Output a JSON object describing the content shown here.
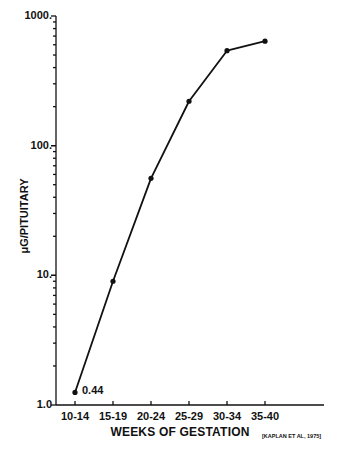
{
  "chart_data": {
    "type": "line",
    "title": "",
    "xlabel": "WEEKS OF GESTATION",
    "ylabel": "μG/PITUITARY",
    "yscale": "log",
    "ylim": [
      1.0,
      1000
    ],
    "y_tick_labels": [
      "1.0",
      "10.",
      "100.",
      "1000."
    ],
    "categories": [
      "10-14",
      "15-19",
      "20-24",
      "25-29",
      "30-34",
      "35-40"
    ],
    "series": [
      {
        "name": "Pituitary content",
        "values": [
          1.25,
          9,
          56,
          220,
          540,
          640
        ],
        "marker": "circle",
        "color": "#111111"
      }
    ],
    "annotations": [
      {
        "text": "0.44",
        "category": "10-14"
      }
    ],
    "source": "[KAPLAN ET AL, 1975]",
    "grid": false,
    "legend": "none"
  },
  "labels": {
    "y_ticks": [
      "1000.",
      "100.",
      "10.",
      "1.0"
    ],
    "x_ticks": [
      "10-14",
      "15-19",
      "20-24",
      "25-29",
      "30-34",
      "35-40"
    ],
    "x_title": "WEEKS OF GESTATION",
    "y_title": "μG/PITUITARY",
    "point_annotation": "0.44",
    "citation": "[KAPLAN ET AL, 1975]"
  }
}
